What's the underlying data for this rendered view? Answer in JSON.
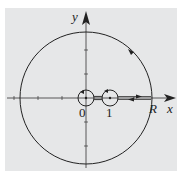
{
  "figure": {
    "background": "#e6e7e8",
    "stroke": "#222222",
    "axes": {
      "x_label": "x",
      "y_label": "y"
    },
    "labels": {
      "origin": "0",
      "one": "1",
      "radius": "R"
    },
    "contour": {
      "large_circle_radius_label": "R",
      "small_circles_at": [
        "0",
        "1"
      ],
      "orientation": "counterclockwise keyhole"
    }
  }
}
